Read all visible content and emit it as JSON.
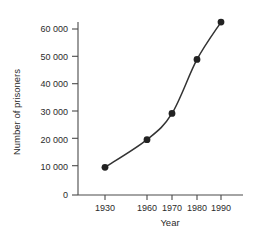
{
  "chart_data": {
    "type": "line",
    "title": "",
    "xlabel": "Year",
    "ylabel": "Number of prisoners",
    "x": [
      1930,
      1960,
      1970,
      1980,
      1990
    ],
    "xtick_labels": [
      "1930",
      "1960",
      "1970",
      "1980",
      "1990"
    ],
    "values": [
      10000,
      20000,
      29500,
      49000,
      62500
    ],
    "ylim": [
      0,
      65000
    ],
    "ytick_values": [
      0,
      10000,
      20000,
      30000,
      40000,
      50000,
      60000
    ],
    "ytick_labels": [
      "0",
      "10 000",
      "20 000",
      "30 000",
      "40 000",
      "50 000",
      "60 000"
    ],
    "grid": false,
    "legend": false,
    "markers": "filled-circle",
    "line_color": "#333333",
    "marker_color": "#222222",
    "axis_color": "#4a4a4a",
    "x_axis_note": "non-linear spacing: 1930 to 1960 gap compressed relative to 10-year steps",
    "x_positions_px": [
      105,
      147,
      172,
      197,
      221
    ],
    "points": [
      {
        "x": "1930",
        "y": 10000
      },
      {
        "x": "1960",
        "y": 20000
      },
      {
        "x": "1970",
        "y": 29500
      },
      {
        "x": "1980",
        "y": 49000
      },
      {
        "x": "1990",
        "y": 62500
      }
    ]
  }
}
